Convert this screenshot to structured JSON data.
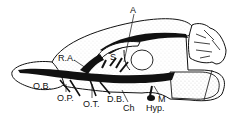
{
  "diagram": {
    "colors": {
      "ink": "#111111",
      "stipple": "#9a9a9a",
      "background": "#ffffff"
    },
    "labels": [
      {
        "id": "A",
        "text": "A",
        "x": 130,
        "y": 6
      },
      {
        "id": "RA",
        "text": "R.A.",
        "x": 58,
        "y": 54
      },
      {
        "id": "S",
        "text": "S",
        "x": 110,
        "y": 53
      },
      {
        "id": "OB",
        "text": "O.B.",
        "x": 33,
        "y": 82
      },
      {
        "id": "OP",
        "text": "O.P.",
        "x": 57,
        "y": 94
      },
      {
        "id": "OT",
        "text": "O.T.",
        "x": 83,
        "y": 100
      },
      {
        "id": "DB",
        "text": "D.B.",
        "x": 107,
        "y": 95
      },
      {
        "id": "Ch",
        "text": "Ch",
        "x": 123,
        "y": 104
      },
      {
        "id": "M",
        "text": "M",
        "x": 158,
        "y": 95
      },
      {
        "id": "Hyp",
        "text": "Hyp.",
        "x": 146,
        "y": 104
      }
    ]
  }
}
